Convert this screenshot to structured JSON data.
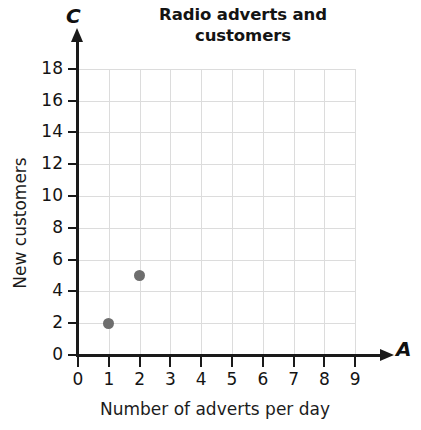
{
  "chart_data": {
    "type": "scatter",
    "title": "Radio adverts and customers",
    "title_line1": "Radio adverts and",
    "title_line2": "customers",
    "xlabel": "Number of adverts per day",
    "ylabel": "New customers",
    "x_axis_letter": "A",
    "y_axis_letter": "C",
    "x": [
      1,
      2
    ],
    "y": [
      2,
      5
    ],
    "points": [
      {
        "x": 1,
        "y": 2
      },
      {
        "x": 2,
        "y": 5
      }
    ],
    "xlim": [
      0,
      9
    ],
    "ylim": [
      0,
      18
    ],
    "x_ticks": [
      0,
      1,
      2,
      3,
      4,
      5,
      6,
      7,
      8,
      9
    ],
    "y_ticks": [
      0,
      2,
      4,
      6,
      8,
      10,
      12,
      14,
      16,
      18
    ],
    "x_tick_labels": [
      "0",
      "1",
      "2",
      "3",
      "4",
      "5",
      "6",
      "7",
      "8",
      "9"
    ],
    "y_tick_labels": [
      "0",
      "2",
      "4",
      "6",
      "8",
      "10",
      "12",
      "14",
      "16",
      "18"
    ],
    "grid": true,
    "legend": false,
    "marker_color": "#6e6e6e",
    "grid_color": "#dcdcdc",
    "axis_color": "#1a1a1a",
    "background_color": "#ffffff"
  }
}
